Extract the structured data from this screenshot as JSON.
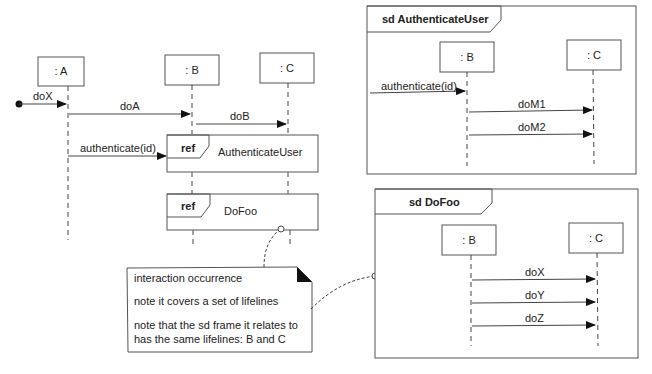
{
  "main_diagram": {
    "lifelines": [
      {
        "id": "A",
        "label": ": A"
      },
      {
        "id": "B",
        "label": ": B"
      },
      {
        "id": "C",
        "label": ": C"
      }
    ],
    "messages": [
      {
        "label": "doX",
        "from": "found",
        "to": "A"
      },
      {
        "label": "doA",
        "from": "A",
        "to": "B"
      },
      {
        "label": "doB",
        "from": "B",
        "to": "C"
      },
      {
        "label": "authenticate(id)",
        "from": "A",
        "to": "ref-AuthenticateUser"
      }
    ],
    "refs": [
      {
        "keyword": "ref",
        "name": "AuthenticateUser"
      },
      {
        "keyword": "ref",
        "name": "DoFoo"
      }
    ]
  },
  "note": {
    "lines": [
      "interaction occurrence",
      "note it covers a set of lifelines",
      "note that the sd frame it relates to",
      "has the same lifelines: B and C"
    ]
  },
  "frames": [
    {
      "title": "sd AuthenticateUser",
      "lifelines": [
        ": B",
        ": C"
      ],
      "messages": [
        "authenticate(id)",
        "doM1",
        "doM2"
      ]
    },
    {
      "title": "sd DoFoo",
      "lifelines": [
        ": B",
        ": C"
      ],
      "messages": [
        "doX",
        "doY",
        "doZ"
      ]
    }
  ]
}
